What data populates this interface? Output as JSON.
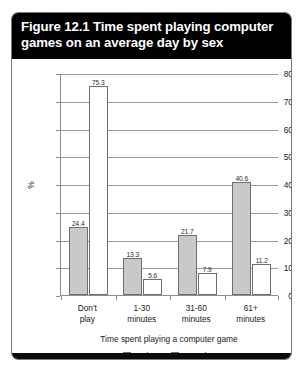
{
  "figure": {
    "title": "Figure 12.1 Time spent playing computer games on an average day by sex"
  },
  "chart_data": {
    "type": "bar",
    "title": "Figure 12.1 Time spent playing computer games on an average day by sex",
    "xlabel": "Time spent playing a computer game",
    "ylabel": "%",
    "ylim": [
      0,
      80
    ],
    "ytick_step": 10,
    "yticks": [
      "0",
      "10",
      "20",
      "30",
      "40",
      "50",
      "60",
      "70",
      "80"
    ],
    "grid": true,
    "legend_position": "bottom",
    "categories": [
      "Don't play",
      "1-30 minutes",
      "31-60 minutes",
      "61+ minutes"
    ],
    "category_lines": [
      [
        "Don't",
        "play"
      ],
      [
        "1-30",
        "minutes"
      ],
      [
        "31-60",
        "minutes"
      ],
      [
        "61+",
        "minutes"
      ]
    ],
    "series": [
      {
        "name": "Males",
        "color": "#c9c9c9",
        "values": [
          24.4,
          13.3,
          21.7,
          40.6
        ],
        "labels": [
          "24.4",
          "13.3",
          "21.7",
          "40.6"
        ]
      },
      {
        "name": "Females",
        "color": "#ffffff",
        "values": [
          75.3,
          5.6,
          7.9,
          11.2
        ],
        "labels": [
          "75.3",
          "5.6",
          "7.9",
          "11.2"
        ]
      }
    ]
  }
}
